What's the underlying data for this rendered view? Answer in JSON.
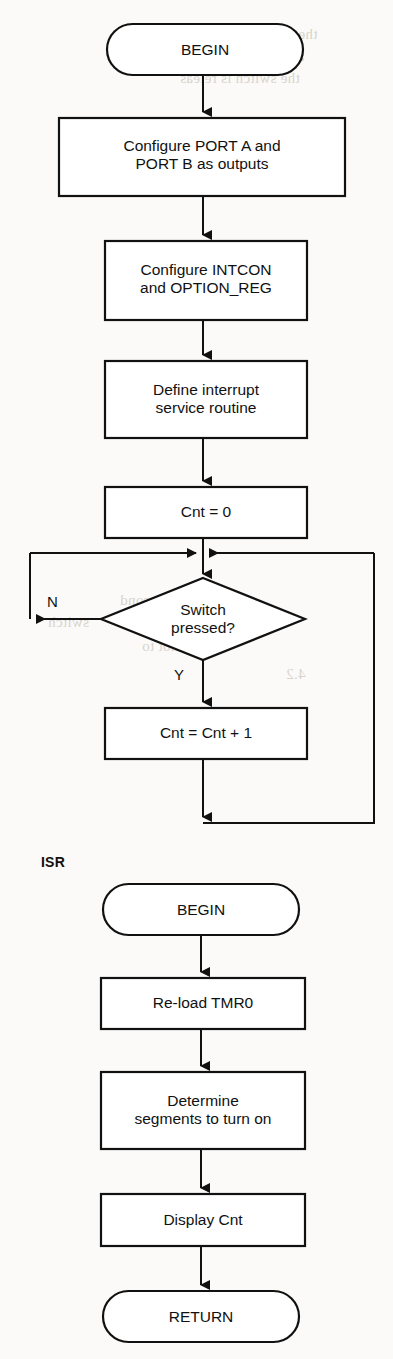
{
  "page": {
    "width": 393,
    "height": 1359,
    "background_color": "#fbfaf8",
    "ink_color": "#111111"
  },
  "ghost_text": [
    {
      "text": "the termination sub",
      "x": 196,
      "y": 26
    },
    {
      "text": "and continues on b",
      "x": 186,
      "y": 48
    },
    {
      "text": "the switch is releas",
      "x": 180,
      "y": 70
    },
    {
      "text": "xim",
      "x": 214,
      "y": 250
    },
    {
      "text": "cond",
      "x": 120,
      "y": 592
    },
    {
      "text": "switch",
      "x": 48,
      "y": 614
    },
    {
      "text": "it is not to",
      "x": 142,
      "y": 638
    },
    {
      "text": "4.2",
      "x": 286,
      "y": 666
    }
  ],
  "flowchart": {
    "main": {
      "section_label": "",
      "nodes": [
        {
          "id": "begin",
          "type": "terminal",
          "label": "BEGIN"
        },
        {
          "id": "cfg_ports",
          "type": "process",
          "label": "Configure PORT A and\nPORT B as outputs"
        },
        {
          "id": "cfg_regs",
          "type": "process",
          "label": "Configure INTCON\nand OPTION_REG"
        },
        {
          "id": "def_isr",
          "type": "process",
          "label": "Define interrupt\nservice routine"
        },
        {
          "id": "cnt_zero",
          "type": "process",
          "label": "Cnt = 0"
        },
        {
          "id": "switch_q",
          "type": "decision",
          "label": "Switch\npressed?"
        },
        {
          "id": "cnt_inc",
          "type": "process",
          "label": "Cnt = Cnt + 1"
        }
      ],
      "branch_labels": {
        "no": "N",
        "yes": "Y"
      }
    },
    "isr": {
      "section_label": "ISR",
      "nodes": [
        {
          "id": "isr_begin",
          "type": "terminal",
          "label": "BEGIN"
        },
        {
          "id": "reload_tmr0",
          "type": "process",
          "label": "Re-load TMR0"
        },
        {
          "id": "determine",
          "type": "process",
          "label": "Determine\nsegments to turn on"
        },
        {
          "id": "display",
          "type": "process",
          "label": "Display Cnt"
        },
        {
          "id": "isr_return",
          "type": "terminal",
          "label": "RETURN"
        }
      ]
    }
  }
}
